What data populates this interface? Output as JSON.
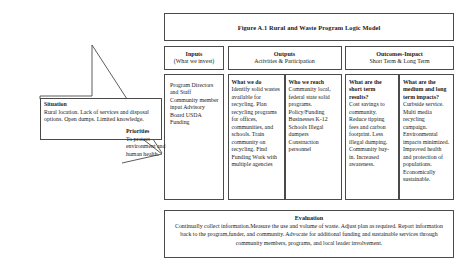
{
  "figure": {
    "title": "Figure A.1 Rural and Waste Program Logic Model"
  },
  "situation": {
    "heading": "Situation",
    "text": "Rural location. Lack of services and disposal options. Open dumps. Limited knowledge."
  },
  "priorities": {
    "heading": "Priorities",
    "text": "To protect environment and human health."
  },
  "headers": [
    {
      "title": "Inputs",
      "subtitle": "(What we invest)"
    },
    {
      "title": "Outputs",
      "subtitle": "Activities &  Participation"
    },
    {
      "title": "Outcomes-Impact",
      "subtitle": "Short Term  & Long Term"
    }
  ],
  "columns": {
    "inputs": {
      "heading": "",
      "text": "Program Directors and Staff Community member input Advisory Board USDA Funding"
    },
    "what_we_do": {
      "heading": "What we do",
      "text": "Identify solid wastes available for recycling. Plan recycling programs for offices, communities, and schools. Train community on recycling. Find Funding Work with multiple agencies"
    },
    "who_we_reach": {
      "heading": "Who we reach",
      "text": "Community local, federal state solid programs. Policy/Funding Businesses K-12 Schools Illegal dumpers Construction personnel"
    },
    "short_term": {
      "heading": "What are the short term results?",
      "text": "Cost savings to community. Reduce tipping fees and carbon footprint. Less illegal dumping. Community buy-in. Increased awareness."
    },
    "long_term": {
      "heading": "What are the medium and long term impacts?",
      "text": "Curbside service. Multi media recycling campaign. Environmental impacts minimized. Improved health and protection of populations. Economically sustainable."
    }
  },
  "evaluation": {
    "heading": "Evaluation",
    "text": "Continually collect information.Measure the use and volume of waste. Adjust plan as required. Report information back to the program,funder, and community. Advocate for additional funding and sustainable services through community members, programs, and local leader involvement."
  },
  "colors": {
    "border": "#4a4a4a",
    "text": "#1a1a1a",
    "background": "#ffffff"
  }
}
